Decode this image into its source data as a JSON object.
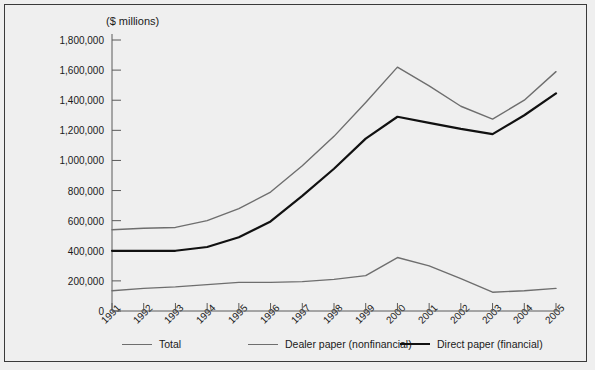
{
  "figure": {
    "background_color": "#efefef",
    "border_color": "#3a3a3a",
    "axis_color": "#5a5a5a"
  },
  "chart_data": {
    "type": "line",
    "title": "",
    "ylabel": "($ millions)",
    "xlabel": "",
    "ylim": [
      0,
      1800000
    ],
    "ytick_step": 200000,
    "grid": false,
    "legend_position": "bottom",
    "categories": [
      "1991",
      "1992",
      "1993",
      "1994",
      "1995",
      "1996",
      "1997",
      "1998",
      "1999",
      "2000",
      "2001",
      "2002",
      "2003",
      "2004",
      "2005"
    ],
    "ytick_labels": [
      "0",
      "200,000",
      "400,000",
      "600,000",
      "800,000",
      "1,000,000",
      "1,200,000",
      "1,400,000",
      "1,600,000",
      "1,800,000"
    ],
    "ytick_values": [
      0,
      200000,
      400000,
      600000,
      800000,
      1000000,
      1200000,
      1400000,
      1600000,
      1800000
    ],
    "series": [
      {
        "name": "Total",
        "color": "#6e6e6e",
        "width": 1.4,
        "values": [
          540000,
          550000,
          555000,
          600000,
          680000,
          790000,
          965000,
          1160000,
          1385000,
          1620000,
          1495000,
          1360000,
          1275000,
          1400000,
          1590000
        ]
      },
      {
        "name": "Dealer paper (nonfinancial)",
        "color": "#6e6e6e",
        "width": 1.4,
        "values": [
          135000,
          150000,
          160000,
          175000,
          190000,
          190000,
          195000,
          210000,
          235000,
          355000,
          300000,
          215000,
          125000,
          135000,
          150000
        ]
      },
      {
        "name": "Direct paper (financial)",
        "color": "#111111",
        "width": 2.2,
        "values": [
          400000,
          400000,
          400000,
          425000,
          490000,
          595000,
          765000,
          945000,
          1145000,
          1290000,
          1250000,
          1210000,
          1175000,
          1300000,
          1445000
        ]
      }
    ]
  },
  "legend": {
    "items": [
      {
        "label": "Total",
        "color": "#6e6e6e",
        "width": 1.4
      },
      {
        "label": "Dealer paper (nonfinancial)",
        "color": "#6e6e6e",
        "width": 1.4
      },
      {
        "label": "Direct paper (financial)",
        "color": "#111111",
        "width": 2.2
      }
    ]
  }
}
